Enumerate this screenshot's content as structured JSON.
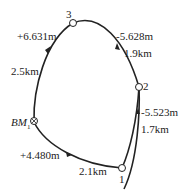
{
  "diagram": {
    "type": "closed leveling route",
    "points": [
      {
        "id": "BM1",
        "label_main": "BM",
        "label_sub": "1"
      },
      {
        "id": "1",
        "label": "1"
      },
      {
        "id": "2",
        "label": "2"
      },
      {
        "id": "3",
        "label": "3"
      }
    ],
    "segments": [
      {
        "from": "BM1",
        "to": "1",
        "height_diff": "+4.480m",
        "distance": "2.1km"
      },
      {
        "from": "1",
        "to": "2",
        "height_diff": "-5.523m",
        "distance": "1.7km"
      },
      {
        "from": "2",
        "to": "3",
        "height_diff": "-5.628m",
        "distance": "1.9km"
      },
      {
        "from": "3",
        "to": "BM1",
        "height_diff": "+6.631m",
        "distance": "2.5km"
      }
    ]
  }
}
